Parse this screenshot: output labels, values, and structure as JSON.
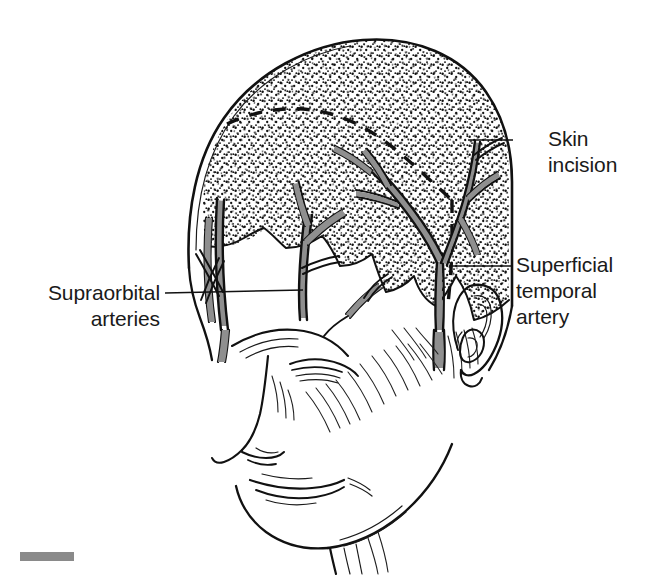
{
  "figure": {
    "background_color": "#ffffff",
    "ink_color": "#111111",
    "artery_fill_color": "#8f8f8f",
    "stipple_color": "#111111"
  },
  "labels": [
    {
      "id": "skin-incision",
      "lines": [
        "Skin",
        "incision"
      ],
      "line1": "Skin",
      "line2": "incision",
      "text_x": 548,
      "text_y": 146,
      "leader": {
        "x1": 513,
        "y1": 140,
        "x2": 468,
        "y2": 140
      }
    },
    {
      "id": "superficial-temporal-artery",
      "lines": [
        "Superficial",
        "temporal",
        "artery"
      ],
      "line1": "Superficial",
      "line2": "temporal",
      "line3": "artery",
      "text_x": 516,
      "text_y": 272,
      "leader": {
        "x1": 513,
        "y1": 266,
        "x2": 455,
        "y2": 266
      }
    },
    {
      "id": "supraorbital-arteries",
      "lines": [
        "Supraorbital",
        "arteries"
      ],
      "line1": "Supraorbital",
      "line2": "arteries",
      "text_x": 156,
      "text_y": 300,
      "text_anchor": "end",
      "leader": {
        "x1": 165,
        "y1": 294,
        "x2": 303,
        "y2": 290
      }
    }
  ],
  "scale_bar": {
    "x": 20,
    "y": 552,
    "width": 54,
    "height": 9,
    "color": "#8a8a8a"
  },
  "annotations": {
    "stipple_region": "hair-bearing scalp shown with stipple shading",
    "dashed_line": "planned bicoronal skin incision",
    "view": "right anterolateral three-quarter view of head"
  }
}
